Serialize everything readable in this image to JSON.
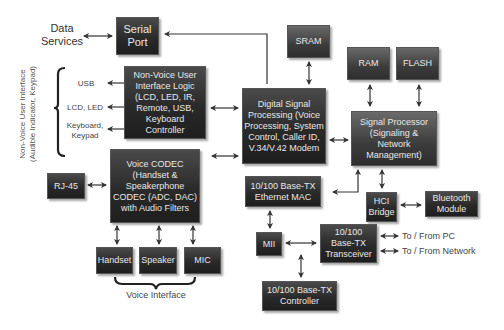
{
  "diagram": {
    "type": "block-diagram",
    "external_labels": {
      "data_services": "Data\nServices",
      "usb": "USB",
      "lcd_led": "LCD, LED",
      "keyboard_keypad": "Keyboard,\nKeypad",
      "non_voice_ui": "Non-Voice User Interface\n(Audible Indicator, Keypad)",
      "voice_interface": "Voice Interface",
      "to_from_pc": "To / From PC",
      "to_from_network": "To / From Network"
    },
    "blocks": {
      "serial_port": "Serial\nPort",
      "non_voice_logic": "Non-Voice User\nInterface Logic\n(LCD, LED, IR,\nRemote, USB,\nKeyboard Controller",
      "voice_codec": "Voice CODEC\n(Handset &\nSpeakerphone\nCODEC (ADC, DAC)\nwith Audio Filters",
      "rj45": "RJ-45",
      "handset": "Handset",
      "speaker": "Speaker",
      "mic": "MIC",
      "sram": "SRAM",
      "ram": "RAM",
      "flash": "FLASH",
      "dsp": "Digital Signal\nProcessing (Voice\nProcessing, System\nControl, Caller ID,\nV.34/V.42 Modem",
      "signal_processor": "Signal Processor\n(Signaling &\nNetwork\nManagement)",
      "ethernet_mac": "10/100 Base-TX\nEthernet MAC",
      "hci_bridge": "HCI\nBridge",
      "bluetooth": "Bluetooth\nModule",
      "mii": "MII",
      "transceiver": "10/100\nBase-TX\nTransceiver",
      "controller": "10/100 Base-TX\nController"
    },
    "colors": {
      "box_fill": "#2a2a2a",
      "box_text": "#e8e8e8",
      "arrow": "#333333",
      "label_text": "#444444"
    }
  }
}
